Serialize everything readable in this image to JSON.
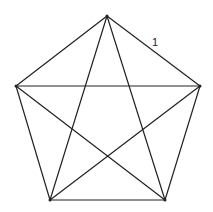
{
  "diagram": {
    "type": "complete-graph-K5",
    "vertices": [
      {
        "id": "top",
        "x": 107,
        "y": 16
      },
      {
        "id": "right",
        "x": 200,
        "y": 86
      },
      {
        "id": "bottom-right",
        "x": 165,
        "y": 200
      },
      {
        "id": "bottom-left",
        "x": 50,
        "y": 200
      },
      {
        "id": "left",
        "x": 16,
        "y": 86
      }
    ],
    "edges": [
      [
        "top",
        "right"
      ],
      [
        "right",
        "bottom-right"
      ],
      [
        "bottom-right",
        "bottom-left"
      ],
      [
        "bottom-left",
        "left"
      ],
      [
        "left",
        "top"
      ],
      [
        "top",
        "bottom-right"
      ],
      [
        "top",
        "bottom-left"
      ],
      [
        "left",
        "right"
      ],
      [
        "left",
        "bottom-right"
      ],
      [
        "right",
        "bottom-left"
      ]
    ],
    "edge_label": {
      "text": "1",
      "x": 152,
      "y": 46
    },
    "stroke_color": "#222222"
  }
}
